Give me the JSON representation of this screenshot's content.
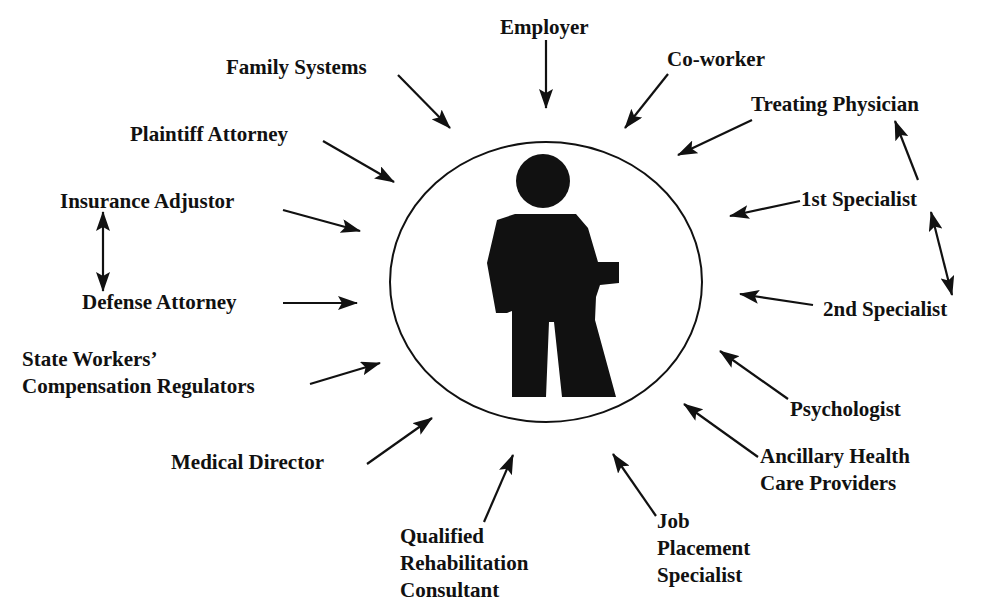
{
  "diagram": {
    "center": {
      "icon": "person-icon",
      "description": "Injured worker silhouette inside circle"
    },
    "colors": {
      "ink": "#111111",
      "background": "#ffffff"
    },
    "nodes": {
      "employer": {
        "lines": [
          "Employer"
        ]
      },
      "coworker": {
        "lines": [
          "Co-worker"
        ]
      },
      "treating_physician": {
        "lines": [
          "Treating Physician"
        ]
      },
      "first_specialist": {
        "lines": [
          "1st Specialist"
        ]
      },
      "second_specialist": {
        "lines": [
          "2nd Specialist"
        ]
      },
      "psychologist": {
        "lines": [
          "Psychologist"
        ]
      },
      "ancillary": {
        "lines": [
          "Ancillary Health",
          "Care Providers"
        ]
      },
      "job_placement": {
        "lines": [
          "Job",
          "Placement",
          "Specialist"
        ]
      },
      "qualified_rehab": {
        "lines": [
          "Qualified",
          "Rehabilitation",
          "Consultant"
        ]
      },
      "medical_director": {
        "lines": [
          "Medical Director"
        ]
      },
      "state_workers": {
        "lines": [
          "State Workers’",
          "Compensation Regulators"
        ]
      },
      "defense_attorney": {
        "lines": [
          "Defense Attorney"
        ]
      },
      "insurance_adjustor": {
        "lines": [
          "Insurance Adjustor"
        ]
      },
      "plaintiff_attorney": {
        "lines": [
          "Plaintiff Attorney"
        ]
      },
      "family_systems": {
        "lines": [
          "Family Systems"
        ]
      }
    },
    "edges": [
      {
        "from": "employer",
        "to": "center",
        "type": "single"
      },
      {
        "from": "coworker",
        "to": "center",
        "type": "single"
      },
      {
        "from": "treating_physician",
        "to": "center",
        "type": "single"
      },
      {
        "from": "first_specialist",
        "to": "center",
        "type": "single"
      },
      {
        "from": "first_specialist",
        "to": "treating_physician",
        "type": "single"
      },
      {
        "from": "first_specialist",
        "to": "second_specialist",
        "type": "double"
      },
      {
        "from": "second_specialist",
        "to": "center",
        "type": "single"
      },
      {
        "from": "psychologist",
        "to": "center",
        "type": "single"
      },
      {
        "from": "ancillary",
        "to": "center",
        "type": "single"
      },
      {
        "from": "job_placement",
        "to": "center",
        "type": "single"
      },
      {
        "from": "qualified_rehab",
        "to": "center",
        "type": "single"
      },
      {
        "from": "medical_director",
        "to": "center",
        "type": "single"
      },
      {
        "from": "state_workers",
        "to": "center",
        "type": "single"
      },
      {
        "from": "defense_attorney",
        "to": "center",
        "type": "single"
      },
      {
        "from": "insurance_adjustor",
        "to": "center",
        "type": "single"
      },
      {
        "from": "insurance_adjustor",
        "to": "defense_attorney",
        "type": "double"
      },
      {
        "from": "plaintiff_attorney",
        "to": "center",
        "type": "single"
      },
      {
        "from": "family_systems",
        "to": "center",
        "type": "single"
      }
    ]
  }
}
